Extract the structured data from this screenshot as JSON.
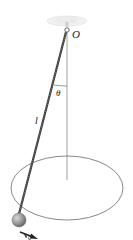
{
  "diagram": {
    "type": "conical-pendulum",
    "labels": {
      "pivot": "O",
      "angle": "θ",
      "length": "l",
      "velocity": "v",
      "velocity_subscript": "0"
    },
    "colors": {
      "line": "#888888",
      "rod": "#3a3a3a",
      "bob": "#9a9a9a",
      "ceiling": "#d8d8d8",
      "text": "#222222"
    }
  }
}
